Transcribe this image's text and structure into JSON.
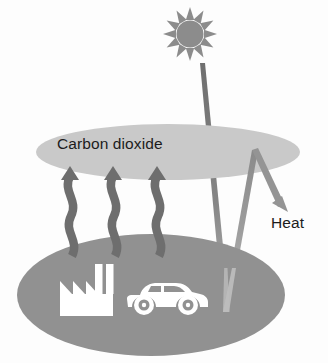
{
  "diagram": {
    "type": "illustration",
    "background_color": "#fdfdfd",
    "labels": {
      "carbon_dioxide": "Carbon dioxide",
      "heat": "Heat"
    },
    "colors": {
      "atmosphere_layer": "#c9c9c9",
      "ground_layer": "#919191",
      "sun": "#8c8c8c",
      "incoming_ray": "#7e7e7e",
      "reflected_ray": "#a8a8a8",
      "heat_arrow": "#8f8f8f",
      "emission_arrow": "#6e6e6e",
      "source_icon": "#ffffff",
      "text": "#1c1c1c"
    },
    "elements": {
      "sun": {
        "name": "sun",
        "center_x": 190,
        "center_y": 34,
        "radius": 13,
        "ray_count": 12
      },
      "atmosphere_ellipse": {
        "name": "carbon-dioxide-layer",
        "center_x": 168,
        "center_y": 152,
        "radius_x": 132,
        "radius_y": 28
      },
      "ground_ellipse": {
        "name": "earth-surface",
        "center_x": 151,
        "center_y": 295,
        "radius_x": 134,
        "radius_y": 61
      },
      "incoming_sunlight": {
        "name": "incoming-solar-radiation",
        "start_x": 202,
        "start_y": 63,
        "end_x": 226,
        "end_y": 312
      },
      "reflected_ray": {
        "name": "reflected-radiation",
        "start_x": 226,
        "start_y": 312,
        "end_x": 255,
        "end_y": 150
      },
      "heat_arrow": {
        "name": "heat-radiation-arrow",
        "start_x": 255,
        "start_y": 150,
        "end_x": 287,
        "end_y": 211
      },
      "emission_arrows": {
        "name": "greenhouse-gas-emission-arrows",
        "count": 3,
        "tip_x_positions": [
          70,
          113,
          157
        ],
        "tip_y": 167,
        "base_y": 253
      },
      "factory": {
        "name": "factory-icon",
        "x": 60,
        "y": 264,
        "width": 53,
        "height": 52,
        "smokestack_count": 2
      },
      "car": {
        "name": "car-icon",
        "x": 126,
        "y": 283,
        "width": 83,
        "height": 33
      }
    }
  }
}
